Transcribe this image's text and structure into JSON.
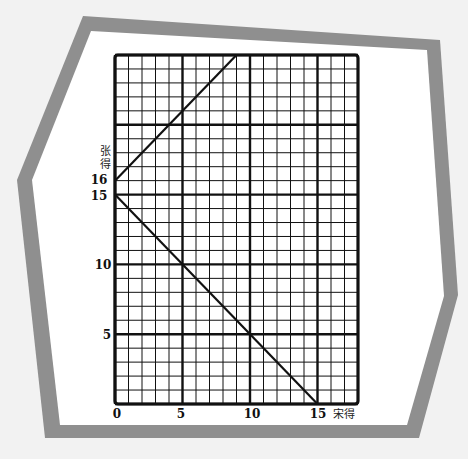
{
  "chart_data": {
    "type": "line",
    "title": "",
    "xlabel": "宋得",
    "ylabel": "张得",
    "xlim": [
      0,
      18
    ],
    "ylim": [
      0,
      25
    ],
    "grid": true,
    "minor_grid_step": 1,
    "major_grid_step": 5,
    "x_ticks": [
      0,
      5,
      10,
      15
    ],
    "y_ticks": [
      5,
      10,
      15,
      16
    ],
    "series": [
      {
        "name": "line-rising",
        "x": [
          0,
          9
        ],
        "y": [
          16,
          25
        ],
        "equation": "y = x + 16"
      },
      {
        "name": "line-falling",
        "x": [
          0,
          15
        ],
        "y": [
          15,
          0
        ],
        "equation": "y = 15 - x"
      }
    ]
  },
  "labels": {
    "x_origin": "0",
    "x5": "5",
    "x10": "10",
    "x15": "15",
    "x_axis_title": "宋得",
    "y5": "5",
    "y10": "10",
    "y15": "15",
    "y16": "16",
    "y_axis_title_1": "张",
    "y_axis_title_2": "得"
  },
  "colors": {
    "background": "#f2f2f2",
    "frame": "#8f8f8f",
    "paper": "#ffffff",
    "grid": "#111111"
  }
}
